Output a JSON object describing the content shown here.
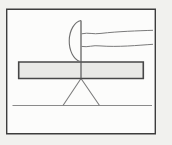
{
  "drawing": {
    "colors": {
      "page_bg": "#f1f1ee",
      "frame_fill": "#fcfcfb",
      "frame_stroke": "#3d3d3d",
      "plank_fill": "#e9e9e6",
      "plank_stroke": "#474747",
      "ground_stroke": "#8a8a8a",
      "fulcrum_stroke": "#7d7d7d",
      "rod_stroke": "#575757",
      "hand_stroke": "#6e6e6e",
      "arm_stroke": "#7a7a7a"
    },
    "paths": {
      "page_bg": "M0,0 H172 V145 H0 Z",
      "frame": "M6.7,9.2 H155.3 V133.8 H6.7 Z",
      "ground": "M12.5,105.5 H152",
      "fulcrum": "M81,78.5 L63,105.5 M81,78.5 L99.5,105.5",
      "plank": "M18.7,62 H143.3 V78.5 H18.7 Z",
      "rod": "M81,20.5 V78.5",
      "fist": "M81,20.5 A13.5,20.8 0 0 0 80,61.5",
      "arm_upper": "M81.5,33.8 C89,32.2 93,34.6 101,33.4 C118,31.4 138,30.8 153,30.3",
      "arm_lower": "M81.5,46.4 C88,47.6 93,44.9 100,45.9 C118,47.3 138,45.3 153,44.3"
    },
    "stroke_widths": {
      "frame": 1.4,
      "plank": 1.6,
      "ground": 1.1,
      "fulcrum": 1.1,
      "rod": 1.2,
      "fist": 1.1,
      "arm": 1
    }
  }
}
